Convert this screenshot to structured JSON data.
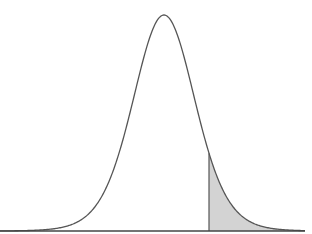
{
  "chart_data": {
    "type": "area",
    "title": "",
    "xlabel": "",
    "ylabel": "",
    "distribution": {
      "shape": "bell",
      "center_px": 164,
      "sigma_px": 31.5,
      "peak_y_px": 15,
      "baseline_y_px": 231,
      "tail_df": 12
    },
    "x_range_px": [
      0,
      305
    ],
    "shaded_region": {
      "side": "right-tail",
      "start_x_px": 209,
      "end_x_px": 305,
      "fill": "#d3d3d3"
    },
    "grid": false,
    "legend": null,
    "colors": {
      "curve": "#555555",
      "baseline": "#444444",
      "shade": "#d3d3d3",
      "shade_edge": "#555555",
      "background": "#ffffff"
    }
  }
}
